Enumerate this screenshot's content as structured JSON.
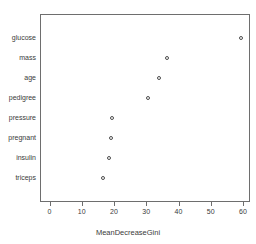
{
  "chart_data": {
    "type": "scatter",
    "title": "",
    "xlabel": "MeanDecreaseGini",
    "ylabel": "",
    "categories": [
      "glucose",
      "mass",
      "age",
      "pedigree",
      "pressure",
      "pregnant",
      "insulin",
      "triceps"
    ],
    "values": [
      59.5,
      36.5,
      34.0,
      30.5,
      19.5,
      19.0,
      18.5,
      16.5
    ],
    "xlim": [
      -1.5,
      62
    ],
    "xticks": [
      0,
      10,
      20,
      30,
      40,
      50,
      60
    ],
    "xticklabels": [
      "0",
      "10",
      "20",
      "30",
      "40",
      "50",
      "60"
    ],
    "grid": false,
    "legend": null,
    "marker": "open-circle",
    "marker_color": "#4d4d4d"
  },
  "axis": {
    "x_title": "MeanDecreaseGini"
  },
  "points": [
    {
      "label": "glucose",
      "value": 59.5
    },
    {
      "label": "mass",
      "value": 36.5
    },
    {
      "label": "age",
      "value": 34.0
    },
    {
      "label": "pedigree",
      "value": 30.5
    },
    {
      "label": "pressure",
      "value": 19.5
    },
    {
      "label": "pregnant",
      "value": 19.0
    },
    {
      "label": "insulin",
      "value": 18.5
    },
    {
      "label": "triceps",
      "value": 16.5
    }
  ],
  "ticks": [
    {
      "label": "0",
      "value": 0
    },
    {
      "label": "10",
      "value": 10
    },
    {
      "label": "20",
      "value": 20
    },
    {
      "label": "30",
      "value": 30
    },
    {
      "label": "40",
      "value": 40
    },
    {
      "label": "50",
      "value": 50
    },
    {
      "label": "60",
      "value": 60
    }
  ]
}
